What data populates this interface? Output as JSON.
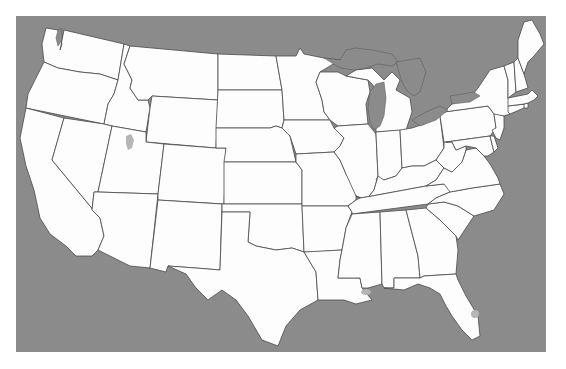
{
  "map": {
    "title": "",
    "type": "choropleth-outline",
    "region": "Contiguous United States",
    "colors": {
      "water": "#8b8b8b",
      "land": "#fdfdfd",
      "border": "#4a4a4a",
      "inland_water": "#b5b5b5",
      "page_background": "#ffffff"
    },
    "frame": {
      "x": 16,
      "y": 16,
      "width": 530,
      "height": 336
    },
    "states": [
      {
        "id": "WA",
        "name": "Washington"
      },
      {
        "id": "OR",
        "name": "Oregon"
      },
      {
        "id": "CA",
        "name": "California"
      },
      {
        "id": "ID",
        "name": "Idaho"
      },
      {
        "id": "NV",
        "name": "Nevada"
      },
      {
        "id": "MT",
        "name": "Montana"
      },
      {
        "id": "WY",
        "name": "Wyoming"
      },
      {
        "id": "UT",
        "name": "Utah"
      },
      {
        "id": "AZ",
        "name": "Arizona"
      },
      {
        "id": "CO",
        "name": "Colorado"
      },
      {
        "id": "NM",
        "name": "New Mexico"
      },
      {
        "id": "ND",
        "name": "North Dakota"
      },
      {
        "id": "SD",
        "name": "South Dakota"
      },
      {
        "id": "NE",
        "name": "Nebraska"
      },
      {
        "id": "KS",
        "name": "Kansas"
      },
      {
        "id": "OK",
        "name": "Oklahoma"
      },
      {
        "id": "TX",
        "name": "Texas"
      },
      {
        "id": "MN",
        "name": "Minnesota"
      },
      {
        "id": "IA",
        "name": "Iowa"
      },
      {
        "id": "MO",
        "name": "Missouri"
      },
      {
        "id": "AR",
        "name": "Arkansas"
      },
      {
        "id": "LA",
        "name": "Louisiana"
      },
      {
        "id": "WI",
        "name": "Wisconsin"
      },
      {
        "id": "IL",
        "name": "Illinois"
      },
      {
        "id": "MI",
        "name": "Michigan"
      },
      {
        "id": "IN",
        "name": "Indiana"
      },
      {
        "id": "OH",
        "name": "Ohio"
      },
      {
        "id": "KY",
        "name": "Kentucky"
      },
      {
        "id": "TN",
        "name": "Tennessee"
      },
      {
        "id": "MS",
        "name": "Mississippi"
      },
      {
        "id": "AL",
        "name": "Alabama"
      },
      {
        "id": "GA",
        "name": "Georgia"
      },
      {
        "id": "FL",
        "name": "Florida"
      },
      {
        "id": "SC",
        "name": "South Carolina"
      },
      {
        "id": "NC",
        "name": "North Carolina"
      },
      {
        "id": "VA",
        "name": "Virginia"
      },
      {
        "id": "WV",
        "name": "West Virginia"
      },
      {
        "id": "PA",
        "name": "Pennsylvania"
      },
      {
        "id": "NY",
        "name": "New York"
      },
      {
        "id": "MD",
        "name": "Maryland"
      },
      {
        "id": "DE",
        "name": "Delaware"
      },
      {
        "id": "NJ",
        "name": "New Jersey"
      },
      {
        "id": "CT",
        "name": "Connecticut"
      },
      {
        "id": "RI",
        "name": "Rhode Island"
      },
      {
        "id": "MA",
        "name": "Massachusetts"
      },
      {
        "id": "VT",
        "name": "Vermont"
      },
      {
        "id": "NH",
        "name": "New Hampshire"
      },
      {
        "id": "ME",
        "name": "Maine"
      }
    ],
    "features": [
      {
        "id": "great-salt-lake",
        "name": "Great Salt Lake"
      },
      {
        "id": "lake-pontchartrain",
        "name": "Lake Pontchartrain"
      },
      {
        "id": "lake-okeechobee",
        "name": "Lake Okeechobee"
      },
      {
        "id": "great-lakes",
        "name": "Great Lakes"
      }
    ]
  }
}
